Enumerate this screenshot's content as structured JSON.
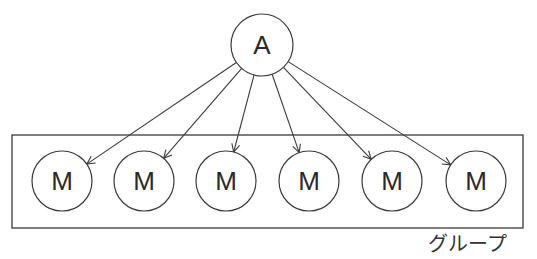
{
  "diagram": {
    "root": {
      "label": "A",
      "cx": 262,
      "cy": 45,
      "r": 31
    },
    "group": {
      "label": "グループ",
      "box": {
        "x": 12,
        "y": 135,
        "width": 511,
        "height": 93
      }
    },
    "members": [
      {
        "label": "M",
        "cx": 62,
        "cy": 181,
        "r": 30
      },
      {
        "label": "M",
        "cx": 144,
        "cy": 181,
        "r": 30
      },
      {
        "label": "M",
        "cx": 226,
        "cy": 181,
        "r": 30
      },
      {
        "label": "M",
        "cx": 309,
        "cy": 181,
        "r": 30
      },
      {
        "label": "M",
        "cx": 392,
        "cy": 181,
        "r": 30
      },
      {
        "label": "M",
        "cx": 476,
        "cy": 181,
        "r": 30
      }
    ],
    "edges_from_root_to_members": true
  }
}
